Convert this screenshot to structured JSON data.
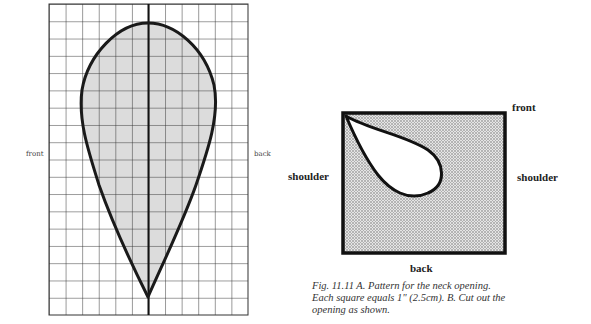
{
  "figure_a": {
    "grid": {
      "columns": 12,
      "rows": 18,
      "left": 49,
      "top": 4,
      "right": 248,
      "bottom": 315
    },
    "shape": "teardrop neck-opening pattern, rounded top, pointed bottom, centered on vertical axis",
    "labels": {
      "left": "front",
      "right": "back"
    },
    "colors": {
      "fill": "#dcdcdc",
      "outline": "#1a1a1a",
      "grid": "#333333"
    }
  },
  "figure_b": {
    "labels": {
      "top": "front",
      "left": "shoulder",
      "right": "shoulder",
      "bottom": "back"
    },
    "colors": {
      "fill": "#bdbdbd",
      "outline": "#111111",
      "opening": "#ffffff"
    }
  },
  "caption": {
    "line1": "Fig. 11.11 A. Pattern for the neck opening.",
    "line2": "Each square equals 1\" (2.5cm). B. Cut out the",
    "line3": "opening as shown."
  }
}
